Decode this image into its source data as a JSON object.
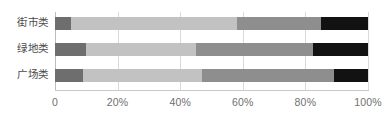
{
  "chart_data": {
    "type": "bar",
    "orientation": "horizontal",
    "stacked": true,
    "normalized": true,
    "title": "",
    "subtitle": "",
    "xlabel": "",
    "ylabel": "",
    "xlim": [
      0,
      100
    ],
    "grid": true,
    "legend": null,
    "categories": [
      "街市类",
      "绿地类",
      "广场类"
    ],
    "x_ticks": [
      {
        "value": 0,
        "label": "0"
      },
      {
        "value": 20,
        "label": "20%"
      },
      {
        "value": 40,
        "label": "40%"
      },
      {
        "value": 60,
        "label": "60%"
      },
      {
        "value": 80,
        "label": "80%"
      },
      {
        "value": 100,
        "label": "100%"
      }
    ],
    "series": [
      {
        "name": "segment-1",
        "color": "#6e6e6e",
        "values": [
          5.0,
          10.0,
          9.0
        ]
      },
      {
        "name": "segment-2",
        "color": "#c2c2c2",
        "values": [
          53.0,
          35.0,
          38.0
        ]
      },
      {
        "name": "segment-3",
        "color": "#8e8e8e",
        "values": [
          27.0,
          37.5,
          42.0
        ]
      },
      {
        "name": "segment-4",
        "color": "#121212",
        "values": [
          15.0,
          17.5,
          11.0
        ]
      }
    ],
    "bars": [
      {
        "category": "街市类",
        "segments": [
          {
            "start": 0.0,
            "end": 5.0,
            "value": 5.0,
            "color": "#6e6e6e"
          },
          {
            "start": 5.0,
            "end": 58.0,
            "value": 53.0,
            "color": "#c2c2c2"
          },
          {
            "start": 58.0,
            "end": 85.0,
            "value": 27.0,
            "color": "#8e8e8e"
          },
          {
            "start": 85.0,
            "end": 100.0,
            "value": 15.0,
            "color": "#121212"
          }
        ]
      },
      {
        "category": "绿地类",
        "segments": [
          {
            "start": 0.0,
            "end": 10.0,
            "value": 10.0,
            "color": "#6e6e6e"
          },
          {
            "start": 10.0,
            "end": 45.0,
            "value": 35.0,
            "color": "#c2c2c2"
          },
          {
            "start": 45.0,
            "end": 82.5,
            "value": 37.5,
            "color": "#8e8e8e"
          },
          {
            "start": 82.5,
            "end": 100.0,
            "value": 17.5,
            "color": "#121212"
          }
        ]
      },
      {
        "category": "广场类",
        "segments": [
          {
            "start": 0.0,
            "end": 9.0,
            "value": 9.0,
            "color": "#6e6e6e"
          },
          {
            "start": 9.0,
            "end": 47.0,
            "value": 38.0,
            "color": "#c2c2c2"
          },
          {
            "start": 47.0,
            "end": 89.0,
            "value": 42.0,
            "color": "#8e8e8e"
          },
          {
            "start": 89.0,
            "end": 100.0,
            "value": 11.0,
            "color": "#121212"
          }
        ]
      }
    ]
  },
  "style": {
    "background": "#ffffff",
    "gridline_color": "#d9d9d9",
    "axis_color": "#c9c9c9",
    "label_color": "#4a4a4a",
    "tick_color": "#6f6f6f"
  }
}
